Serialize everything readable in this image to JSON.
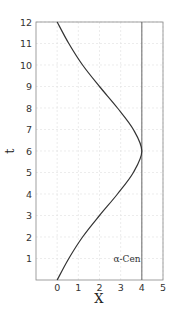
{
  "chart_data": {
    "type": "line",
    "title": "",
    "xlabel": "X",
    "ylabel": "t",
    "xlim": [
      -1,
      5
    ],
    "ylim": [
      0,
      12
    ],
    "x_ticks": [
      "0",
      "1",
      "2",
      "3",
      "4",
      "5"
    ],
    "y_ticks": [
      "1",
      "2",
      "3",
      "4",
      "5",
      "6",
      "7",
      "8",
      "9",
      "10",
      "11",
      "12"
    ],
    "grid": true,
    "series": [
      {
        "name": "worldline",
        "x": [
          0,
          0.55,
          1.2,
          2.0,
          2.85,
          3.6,
          4.0,
          3.6,
          2.85,
          2.0,
          1.2,
          0.55,
          0
        ],
        "t": [
          0,
          1,
          2,
          3,
          4,
          5,
          6,
          7,
          8,
          9,
          10,
          11,
          12
        ]
      },
      {
        "name": "α-Cen",
        "x": [
          4,
          4
        ],
        "t": [
          0,
          12
        ]
      }
    ],
    "annotations": [
      {
        "text": "α-Cen",
        "x": 3.3,
        "t": 1.0
      }
    ]
  }
}
